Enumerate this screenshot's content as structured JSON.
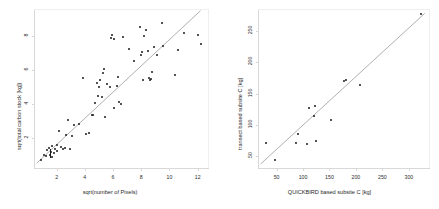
{
  "figure": {
    "background": "#ffffff",
    "point_color": "#1a1a1a",
    "line_color": "#9a9a9a",
    "axis_color": "#d8d8d8"
  },
  "chart_data": [
    {
      "type": "scatter",
      "panel": "left",
      "title": "",
      "xlabel": "sqrt(number of Pixels)",
      "ylabel": "sqrt(total carbon stock [kg])",
      "xlim": [
        0.4,
        12.8
      ],
      "ylim": [
        0.2,
        9.6
      ],
      "xticks": [
        2,
        4,
        6,
        8,
        10,
        12
      ],
      "yticks": [
        2,
        4,
        6,
        8
      ],
      "grid": false,
      "legend": "none",
      "regression_line": {
        "x": [
          0.6,
          12.2
        ],
        "y": [
          0.55,
          9.5
        ]
      },
      "annotations": [
        {
          "kind": "vertical-tick-marker",
          "x": 1.55,
          "y": 1.15
        }
      ],
      "points": [
        {
          "x": 0.9,
          "y": 0.75
        },
        {
          "x": 1.1,
          "y": 1.0
        },
        {
          "x": 1.25,
          "y": 0.95
        },
        {
          "x": 1.3,
          "y": 1.3
        },
        {
          "x": 1.45,
          "y": 1.45
        },
        {
          "x": 1.5,
          "y": 1.05
        },
        {
          "x": 1.6,
          "y": 1.2
        },
        {
          "x": 1.65,
          "y": 0.9
        },
        {
          "x": 1.7,
          "y": 1.55
        },
        {
          "x": 1.8,
          "y": 1.15
        },
        {
          "x": 1.9,
          "y": 1.35
        },
        {
          "x": 2.0,
          "y": 1.6
        },
        {
          "x": 2.05,
          "y": 1.25
        },
        {
          "x": 2.15,
          "y": 2.45
        },
        {
          "x": 2.3,
          "y": 1.5
        },
        {
          "x": 2.45,
          "y": 1.4
        },
        {
          "x": 2.6,
          "y": 1.45
        },
        {
          "x": 2.7,
          "y": 2.2
        },
        {
          "x": 2.8,
          "y": 3.05
        },
        {
          "x": 2.95,
          "y": 1.4
        },
        {
          "x": 3.1,
          "y": 2.15
        },
        {
          "x": 3.2,
          "y": 2.8
        },
        {
          "x": 3.6,
          "y": 2.85
        },
        {
          "x": 3.9,
          "y": 5.55
        },
        {
          "x": 4.1,
          "y": 2.25
        },
        {
          "x": 4.3,
          "y": 2.3
        },
        {
          "x": 4.5,
          "y": 3.4
        },
        {
          "x": 4.6,
          "y": 3.4
        },
        {
          "x": 4.75,
          "y": 4.05
        },
        {
          "x": 4.85,
          "y": 5.25
        },
        {
          "x": 4.9,
          "y": 4.5
        },
        {
          "x": 5.0,
          "y": 5.0
        },
        {
          "x": 5.05,
          "y": 5.4
        },
        {
          "x": 5.2,
          "y": 4.45
        },
        {
          "x": 5.3,
          "y": 5.85
        },
        {
          "x": 5.35,
          "y": 6.1
        },
        {
          "x": 5.45,
          "y": 3.25
        },
        {
          "x": 5.6,
          "y": 5.2
        },
        {
          "x": 5.75,
          "y": 5.0
        },
        {
          "x": 5.85,
          "y": 7.9
        },
        {
          "x": 5.95,
          "y": 8.1
        },
        {
          "x": 6.05,
          "y": 7.85
        },
        {
          "x": 6.1,
          "y": 3.8
        },
        {
          "x": 6.25,
          "y": 5.05
        },
        {
          "x": 6.35,
          "y": 5.6
        },
        {
          "x": 6.45,
          "y": 4.15
        },
        {
          "x": 6.55,
          "y": 4.0
        },
        {
          "x": 6.7,
          "y": 7.95
        },
        {
          "x": 7.1,
          "y": 7.25
        },
        {
          "x": 7.5,
          "y": 6.55
        },
        {
          "x": 7.9,
          "y": 8.55
        },
        {
          "x": 8.0,
          "y": 6.9
        },
        {
          "x": 8.05,
          "y": 7.1
        },
        {
          "x": 8.1,
          "y": 5.45
        },
        {
          "x": 8.2,
          "y": 8.0
        },
        {
          "x": 8.35,
          "y": 8.35
        },
        {
          "x": 8.45,
          "y": 7.15
        },
        {
          "x": 8.55,
          "y": 5.55
        },
        {
          "x": 8.65,
          "y": 5.45
        },
        {
          "x": 8.7,
          "y": 5.5
        },
        {
          "x": 8.75,
          "y": 5.9
        },
        {
          "x": 8.9,
          "y": 7.35
        },
        {
          "x": 9.1,
          "y": 6.9
        },
        {
          "x": 9.45,
          "y": 8.8
        },
        {
          "x": 9.55,
          "y": 7.4
        },
        {
          "x": 10.4,
          "y": 5.7
        },
        {
          "x": 10.6,
          "y": 7.2
        },
        {
          "x": 11.0,
          "y": 8.2
        },
        {
          "x": 12.0,
          "y": 8.05
        },
        {
          "x": 12.2,
          "y": 7.55
        }
      ]
    },
    {
      "type": "scatter",
      "panel": "right",
      "title": "",
      "xlabel": "QUICKBIRD based subsite C [kg]",
      "ylabel": "transect based subsite C [kg]",
      "xlim": [
        15,
        340
      ],
      "ylim": [
        30,
        285
      ],
      "xticks": [
        50,
        100,
        150,
        200,
        250,
        300
      ],
      "yticks": [
        50,
        100,
        150,
        200,
        250
      ],
      "grid": false,
      "legend": "none",
      "regression_line": {
        "x": [
          20,
          330
        ],
        "y": [
          38,
          278
        ]
      },
      "points": [
        {
          "x": 30,
          "y": 72
        },
        {
          "x": 47,
          "y": 45
        },
        {
          "x": 87,
          "y": 72
        },
        {
          "x": 90,
          "y": 85
        },
        {
          "x": 108,
          "y": 70
        },
        {
          "x": 112,
          "y": 128
        },
        {
          "x": 120,
          "y": 115
        },
        {
          "x": 122,
          "y": 131
        },
        {
          "x": 125,
          "y": 75
        },
        {
          "x": 152,
          "y": 108
        },
        {
          "x": 178,
          "y": 170
        },
        {
          "x": 181,
          "y": 172
        },
        {
          "x": 208,
          "y": 164
        },
        {
          "x": 323,
          "y": 277
        }
      ]
    }
  ]
}
